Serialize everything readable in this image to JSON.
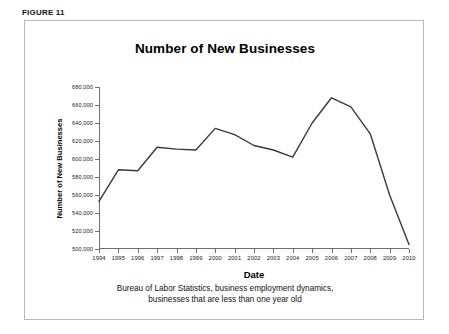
{
  "figure": {
    "label": "FIGURE 11"
  },
  "chart_data": {
    "type": "line",
    "title": "Number of New Businesses",
    "xlabel": "Date",
    "ylabel": "Number of New Businesses",
    "source_note_line1": "Bureau of Labor Statistics, business employment dynamics,",
    "source_note_line2": "businesses that are less than one year old",
    "categories": [
      "1994",
      "1995",
      "1996",
      "1997",
      "1998",
      "1999",
      "2000",
      "2001",
      "2002",
      "2003",
      "2004",
      "2005",
      "2006",
      "2007",
      "2008",
      "2009",
      "2010"
    ],
    "values": [
      553000,
      588000,
      587000,
      613000,
      611000,
      610000,
      634000,
      627000,
      615000,
      610000,
      602000,
      640000,
      668000,
      658000,
      628000,
      560000,
      505000
    ],
    "ylim": [
      500000,
      680000
    ],
    "ytick_values": [
      500000,
      520000,
      540000,
      560000,
      580000,
      600000,
      620000,
      640000,
      660000,
      680000
    ],
    "ytick_labels": [
      "500,000",
      "520,000",
      "540,000",
      "560,000",
      "580,000",
      "600,000",
      "620,000",
      "640,000",
      "660,000",
      "680,000"
    ],
    "grid": false,
    "legend": "none",
    "line_color": "#3a3a3a",
    "axis_color": "#6f6f6f"
  }
}
